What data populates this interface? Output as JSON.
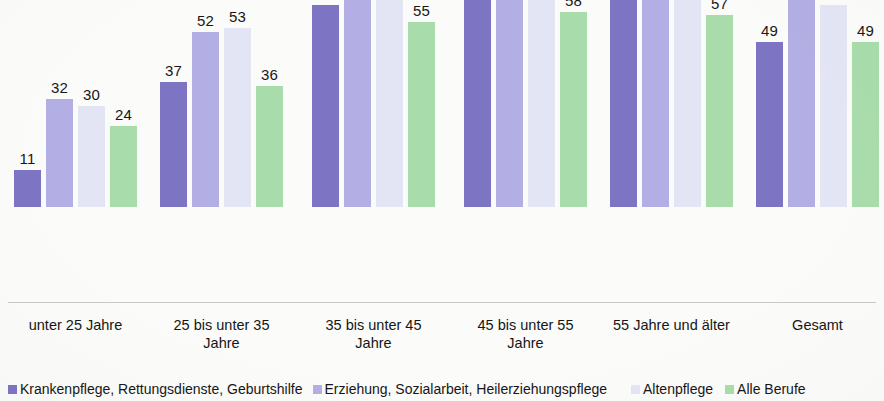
{
  "chart_data": {
    "type": "bar",
    "title": "",
    "subtitle": "",
    "xlabel": "",
    "ylabel": "",
    "grid": false,
    "legend_position": "bottom",
    "ylim": [
      0,
      80
    ],
    "axis_visible": false,
    "value_labels_shown": true,
    "categories": [
      "unter 25 Jahre",
      "25 bis unter 35 Jahre",
      "35 bis unter 45 Jahre",
      "45 bis unter 55 Jahre",
      "55 Jahre und älter",
      "Gesamt"
    ],
    "category_lines": [
      [
        "unter 25 Jahre"
      ],
      [
        "25 bis unter 35",
        "Jahre"
      ],
      [
        "35 bis unter 45",
        "Jahre"
      ],
      [
        "45 bis unter 55",
        "Jahre"
      ],
      [
        "55 Jahre und älter"
      ],
      [
        "Gesamt"
      ]
    ],
    "series": [
      {
        "name": "Krankenpflege, Rettungsdienste, Geburtshilfe",
        "color": "#7d74c4",
        "values": [
          11,
          37,
          60,
          63,
          64,
          49
        ]
      },
      {
        "name": "Erziehung, Sozialarbeit, Heilerziehungspflege",
        "color": "#b3aee3",
        "values": [
          32,
          52,
          71,
          73,
          70,
          62
        ]
      },
      {
        "name": "Altenpflege",
        "color": "#e3e4f4",
        "values": [
          30,
          53,
          65,
          66,
          69,
          60
        ]
      },
      {
        "name": "Alle Berufe",
        "color": "#a9dcab",
        "values": [
          24,
          36,
          55,
          58,
          57,
          49
        ]
      }
    ]
  },
  "legend": {
    "items": [
      {
        "label": "Krankenpflege, Rettungsdienste, Geburtshilfe",
        "color": "#7d74c4"
      },
      {
        "label": "Erziehung, Sozialarbeit, Heilerziehungspflege",
        "color": "#b3aee3"
      },
      {
        "label": "Altenpflege",
        "color": "#e3e4f4"
      },
      {
        "label": "Alle Berufe",
        "color": "#a9dcab"
      }
    ]
  }
}
